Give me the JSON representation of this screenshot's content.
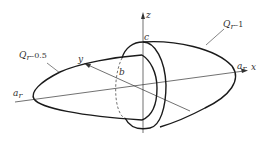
{
  "diagram": {
    "axes": {
      "x_label": "x",
      "y_label": "y",
      "z_label": "z"
    },
    "points": {
      "a_r_left": {
        "base": "a",
        "sub": "r"
      },
      "a_r_right": {
        "base": "a",
        "sub": "r"
      },
      "b": "b",
      "c": "c"
    },
    "curves": [
      {
        "id": "q05",
        "label_base": "Q",
        "label_sub": "r",
        "label_suffix": "–0.5"
      },
      {
        "id": "q1",
        "label_base": "Q",
        "label_sub": "r",
        "label_suffix": "–1"
      }
    ],
    "colors": {
      "line": "#1a1a1a",
      "background": "#ffffff"
    }
  }
}
